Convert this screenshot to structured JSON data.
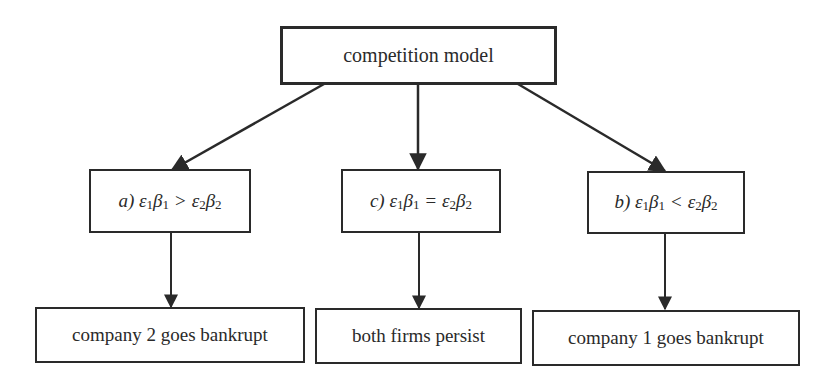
{
  "diagram": {
    "root": {
      "label": "competition model"
    },
    "conditions": [
      {
        "id": "a",
        "prefix": "a)",
        "lhs_eps": "ε",
        "lhs_eps_sub": "1",
        "lhs_beta": "β",
        "lhs_beta_sub": "1",
        "operator": ">",
        "rhs_eps": "ε",
        "rhs_eps_sub": "2",
        "rhs_beta": "β",
        "rhs_beta_sub": "2",
        "text": "a) ε1β1 > ε2β2"
      },
      {
        "id": "c",
        "prefix": "c)",
        "lhs_eps": "ε",
        "lhs_eps_sub": "1",
        "lhs_beta": "β",
        "lhs_beta_sub": "1",
        "operator": "=",
        "rhs_eps": "ε",
        "rhs_eps_sub": "2",
        "rhs_beta": "β",
        "rhs_beta_sub": "2",
        "text": "c) ε1β1 = ε2β2"
      },
      {
        "id": "b",
        "prefix": "b)",
        "lhs_eps": "ε",
        "lhs_eps_sub": "1",
        "lhs_beta": "β",
        "lhs_beta_sub": "1",
        "operator": "<",
        "rhs_eps": "ε",
        "rhs_eps_sub": "2",
        "rhs_beta": "β",
        "rhs_beta_sub": "2",
        "text": "b) ε1β1 < ε2β2"
      }
    ],
    "outcomes": [
      {
        "label": "company 2 goes bankrupt"
      },
      {
        "label": "both firms persist"
      },
      {
        "label": "company 1 goes bankrupt"
      }
    ],
    "edges": [
      {
        "from": "competition model",
        "to": "a) ε1β1 > ε2β2"
      },
      {
        "from": "competition model",
        "to": "c) ε1β1 = ε2β2"
      },
      {
        "from": "competition model",
        "to": "b) ε1β1 < ε2β2"
      },
      {
        "from": "a) ε1β1 > ε2β2",
        "to": "company 2 goes bankrupt"
      },
      {
        "from": "c) ε1β1 = ε2β2",
        "to": "both firms persist"
      },
      {
        "from": "b) ε1β1 < ε2β2",
        "to": "company 1 goes bankrupt"
      }
    ],
    "colors": {
      "stroke": "#2a2a2a",
      "background": "#ffffff",
      "text": "#2a2a2a"
    }
  }
}
